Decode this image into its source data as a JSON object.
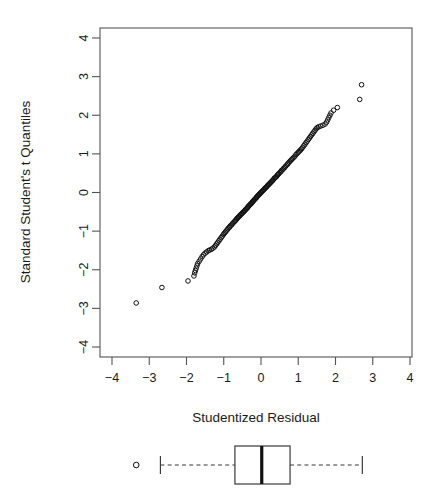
{
  "chart_data": {
    "type": "scatter",
    "title": "",
    "subtitle": "",
    "xlabel": "Studentized Residual",
    "ylabel": "Standard Student's t Quantiles",
    "xlim": [
      -4.3,
      4.3
    ],
    "ylim": [
      -4.3,
      4.3
    ],
    "xticks": [
      -4,
      -3,
      -2,
      -1,
      0,
      1,
      2,
      3,
      4
    ],
    "xticklabels": [
      "−4",
      "−3",
      "−2",
      "−1",
      "0",
      "1",
      "2",
      "3",
      "4"
    ],
    "yticks": [
      -4,
      -3,
      -2,
      -1,
      0,
      1,
      2,
      3,
      4
    ],
    "yticklabels": [
      "−4",
      "−3",
      "−2",
      "−1",
      "0",
      "1",
      "2",
      "3",
      "4"
    ],
    "grid": false,
    "legend": null,
    "marker": "open-circle",
    "marker_color": "#111111",
    "points": [
      [
        -3.35,
        -2.86
      ],
      [
        -2.66,
        -2.46
      ],
      [
        -1.96,
        -2.29
      ],
      [
        -1.8,
        -2.16
      ],
      [
        -1.78,
        -2.08
      ],
      [
        -1.76,
        -2.02
      ],
      [
        -1.74,
        -1.96
      ],
      [
        -1.72,
        -1.9
      ],
      [
        -1.7,
        -1.84
      ],
      [
        -1.66,
        -1.78
      ],
      [
        -1.62,
        -1.72
      ],
      [
        -1.58,
        -1.66
      ],
      [
        -1.54,
        -1.61
      ],
      [
        -1.5,
        -1.57
      ],
      [
        -1.46,
        -1.54
      ],
      [
        -1.42,
        -1.51
      ],
      [
        -1.38,
        -1.49
      ],
      [
        -1.33,
        -1.47
      ],
      [
        -1.29,
        -1.44
      ],
      [
        -1.25,
        -1.41
      ],
      [
        -1.22,
        -1.37
      ],
      [
        -1.19,
        -1.33
      ],
      [
        -1.16,
        -1.29
      ],
      [
        -1.13,
        -1.25
      ],
      [
        -1.1,
        -1.21
      ],
      [
        -1.07,
        -1.17
      ],
      [
        -1.04,
        -1.13
      ],
      [
        -1.01,
        -1.09
      ],
      [
        -0.99,
        -1.06
      ],
      [
        -0.96,
        -1.03
      ],
      [
        -0.94,
        -1.0
      ],
      [
        -0.91,
        -0.97
      ],
      [
        -0.89,
        -0.94
      ],
      [
        -0.86,
        -0.91
      ],
      [
        -0.84,
        -0.89
      ],
      [
        -0.82,
        -0.86
      ],
      [
        -0.79,
        -0.84
      ],
      [
        -0.77,
        -0.81
      ],
      [
        -0.75,
        -0.79
      ],
      [
        -0.72,
        -0.76
      ],
      [
        -0.7,
        -0.74
      ],
      [
        -0.68,
        -0.72
      ],
      [
        -0.66,
        -0.69
      ],
      [
        -0.64,
        -0.67
      ],
      [
        -0.62,
        -0.65
      ],
      [
        -0.6,
        -0.63
      ],
      [
        -0.58,
        -0.61
      ],
      [
        -0.56,
        -0.59
      ],
      [
        -0.54,
        -0.57
      ],
      [
        -0.52,
        -0.55
      ],
      [
        -0.5,
        -0.53
      ],
      [
        -0.48,
        -0.51
      ],
      [
        -0.46,
        -0.49
      ],
      [
        -0.44,
        -0.47
      ],
      [
        -0.42,
        -0.45
      ],
      [
        -0.4,
        -0.43
      ],
      [
        -0.38,
        -0.41
      ],
      [
        -0.36,
        -0.39
      ],
      [
        -0.35,
        -0.37
      ],
      [
        -0.33,
        -0.35
      ],
      [
        -0.31,
        -0.33
      ],
      [
        -0.29,
        -0.31
      ],
      [
        -0.27,
        -0.29
      ],
      [
        -0.25,
        -0.27
      ],
      [
        -0.23,
        -0.25
      ],
      [
        -0.22,
        -0.23
      ],
      [
        -0.2,
        -0.21
      ],
      [
        -0.18,
        -0.19
      ],
      [
        -0.16,
        -0.17
      ],
      [
        -0.14,
        -0.15
      ],
      [
        -0.12,
        -0.13
      ],
      [
        -0.11,
        -0.11
      ],
      [
        -0.09,
        -0.09
      ],
      [
        -0.07,
        -0.07
      ],
      [
        -0.05,
        -0.05
      ],
      [
        -0.03,
        -0.03
      ],
      [
        -0.01,
        -0.01
      ],
      [
        0.01,
        0.01
      ],
      [
        0.03,
        0.03
      ],
      [
        0.05,
        0.05
      ],
      [
        0.07,
        0.07
      ],
      [
        0.09,
        0.09
      ],
      [
        0.11,
        0.11
      ],
      [
        0.13,
        0.13
      ],
      [
        0.15,
        0.15
      ],
      [
        0.17,
        0.17
      ],
      [
        0.19,
        0.19
      ],
      [
        0.21,
        0.21
      ],
      [
        0.23,
        0.23
      ],
      [
        0.25,
        0.25
      ],
      [
        0.27,
        0.27
      ],
      [
        0.29,
        0.29
      ],
      [
        0.31,
        0.31
      ],
      [
        0.33,
        0.33
      ],
      [
        0.35,
        0.36
      ],
      [
        0.37,
        0.38
      ],
      [
        0.4,
        0.4
      ],
      [
        0.42,
        0.42
      ],
      [
        0.44,
        0.45
      ],
      [
        0.46,
        0.47
      ],
      [
        0.48,
        0.49
      ],
      [
        0.51,
        0.52
      ],
      [
        0.53,
        0.54
      ],
      [
        0.55,
        0.57
      ],
      [
        0.58,
        0.59
      ],
      [
        0.6,
        0.62
      ],
      [
        0.63,
        0.64
      ],
      [
        0.65,
        0.67
      ],
      [
        0.68,
        0.7
      ],
      [
        0.71,
        0.73
      ],
      [
        0.73,
        0.76
      ],
      [
        0.76,
        0.79
      ],
      [
        0.79,
        0.82
      ],
      [
        0.82,
        0.85
      ],
      [
        0.85,
        0.88
      ],
      [
        0.88,
        0.91
      ],
      [
        0.91,
        0.94
      ],
      [
        0.94,
        0.98
      ],
      [
        0.97,
        1.01
      ],
      [
        1.0,
        1.04
      ],
      [
        1.03,
        1.07
      ],
      [
        1.06,
        1.1
      ],
      [
        1.09,
        1.13
      ],
      [
        1.12,
        1.17
      ],
      [
        1.15,
        1.21
      ],
      [
        1.18,
        1.25
      ],
      [
        1.21,
        1.29
      ],
      [
        1.24,
        1.33
      ],
      [
        1.27,
        1.37
      ],
      [
        1.3,
        1.41
      ],
      [
        1.33,
        1.45
      ],
      [
        1.36,
        1.49
      ],
      [
        1.39,
        1.53
      ],
      [
        1.42,
        1.57
      ],
      [
        1.45,
        1.61
      ],
      [
        1.48,
        1.65
      ],
      [
        1.51,
        1.68
      ],
      [
        1.55,
        1.7
      ],
      [
        1.6,
        1.72
      ],
      [
        1.66,
        1.74
      ],
      [
        1.72,
        1.77
      ],
      [
        1.76,
        1.82
      ],
      [
        1.79,
        1.88
      ],
      [
        1.82,
        1.94
      ],
      [
        1.85,
        2.0
      ],
      [
        1.88,
        2.06
      ],
      [
        1.95,
        2.13
      ],
      [
        2.05,
        2.2
      ],
      [
        2.65,
        2.41
      ],
      [
        2.7,
        2.79
      ]
    ],
    "boxplot": {
      "orientation": "horizontal",
      "min_whisker": -2.7,
      "q1": -0.7,
      "median": 0.02,
      "q3": 0.78,
      "max_whisker": 2.72,
      "outliers": [
        -3.35
      ]
    }
  },
  "figure": {
    "background": "#ffffff",
    "axis_color": "#555555",
    "text_color": "#1a1a1a",
    "point_color": "#111111"
  }
}
